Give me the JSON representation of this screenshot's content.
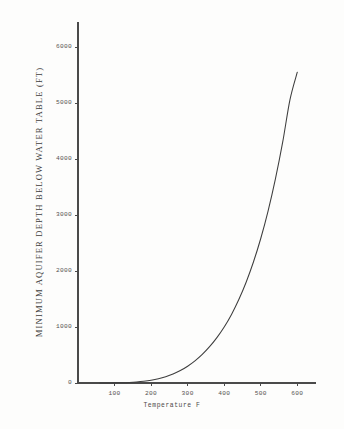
{
  "chart_data": {
    "type": "line",
    "title": "",
    "subtitle": "",
    "xlabel": "Temperature F",
    "ylabel": "MINIMUM AQUIFER DEPTH BELOW WATER TABLE (FT)",
    "xlim": [
      0,
      650
    ],
    "ylim": [
      0,
      6200
    ],
    "xticks": [
      100,
      200,
      300,
      400,
      500,
      600
    ],
    "xtick_labels": [
      "100",
      "200",
      "300",
      "400",
      "500",
      "600"
    ],
    "yticks": [
      0,
      1000,
      2000,
      3000,
      4000,
      5000,
      6000
    ],
    "ytick_labels": [
      "0",
      "1000",
      "2000",
      "3000",
      "4000",
      "5000",
      "6000"
    ],
    "grid": false,
    "legend": null,
    "legend_position": "none",
    "annotations": [],
    "series": [
      {
        "name": "Minimum aquifer depth",
        "color": "#3d3d3d",
        "x": [
          60,
          80,
          100,
          120,
          140,
          160,
          180,
          200,
          220,
          240,
          260,
          280,
          300,
          320,
          340,
          360,
          380,
          400,
          420,
          440,
          460,
          480,
          500,
          520,
          540,
          560,
          580,
          600
        ],
        "y": [
          0,
          0,
          2,
          5,
          10,
          18,
          30,
          48,
          75,
          112,
          160,
          222,
          300,
          395,
          510,
          648,
          810,
          1000,
          1225,
          1490,
          1800,
          2160,
          2580,
          3070,
          3640,
          4300,
          5060,
          5550
        ]
      }
    ]
  },
  "axes": {
    "x_axis_name": "temperature-axis",
    "y_axis_name": "depth-axis"
  }
}
